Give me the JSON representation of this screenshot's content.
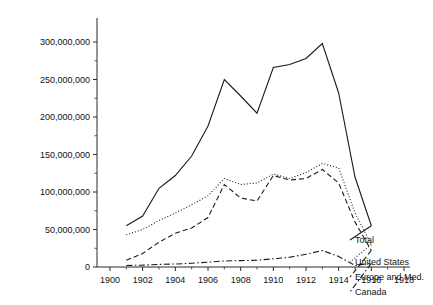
{
  "chart_data": {
    "type": "line",
    "title": "",
    "subtitle": "",
    "xlabel": "",
    "ylabel": "",
    "xlim": [
      1899,
      1918.6
    ],
    "ylim": [
      0,
      310000000
    ],
    "grid": false,
    "legend_position": "inline-right",
    "x_ticks_major": [
      1900,
      1902,
      1904,
      1906,
      1908,
      1910,
      1912,
      1914,
      1916,
      1918
    ],
    "x_ticks_minor": [
      1901,
      1903,
      1905,
      1907,
      1909,
      1911,
      1913,
      1915,
      1917
    ],
    "x_tick_labels": [
      "1900",
      "1902",
      "1904",
      "1906",
      "1908",
      "1910",
      "1912",
      "1914",
      "1916",
      "1918"
    ],
    "y_ticks_major": [
      0,
      50000000,
      100000000,
      150000000,
      200000000,
      250000000,
      300000000
    ],
    "y_ticks_minor": [
      25000000,
      75000000,
      125000000,
      175000000,
      225000000,
      275000000
    ],
    "y_tick_labels": [
      "0",
      "50,000,000",
      "100,000,000",
      "150,000,000",
      "200,000,000",
      "250,000,000",
      "300,000,000"
    ],
    "x": [
      1901,
      1902,
      1903,
      1904,
      1905,
      1906,
      1907,
      1908,
      1909,
      1910,
      1911,
      1912,
      1913,
      1914,
      1915,
      1916
    ],
    "series": [
      {
        "name": "Total",
        "style": "solid",
        "color": "#1a1a1a",
        "label_value": "Total",
        "values": [
          55000000,
          68000000,
          105000000,
          122000000,
          148000000,
          188000000,
          250000000,
          228000000,
          205000000,
          266000000,
          270000000,
          278000000,
          298000000,
          232000000,
          120000000,
          55000000
        ]
      },
      {
        "name": "United States",
        "style": "dotted",
        "color": "#1a1a1a",
        "label_value": "United States",
        "values": [
          43000000,
          50000000,
          62000000,
          72000000,
          83000000,
          95000000,
          118000000,
          110000000,
          112000000,
          124000000,
          118000000,
          126000000,
          138000000,
          132000000,
          72000000,
          30000000
        ]
      },
      {
        "name": "Europe and Med.",
        "style": "dashed",
        "color": "#1a1a1a",
        "label_value": "Europe and Med.",
        "values": [
          9000000,
          18000000,
          33000000,
          45000000,
          52000000,
          66000000,
          110000000,
          92000000,
          88000000,
          122000000,
          116000000,
          118000000,
          130000000,
          112000000,
          60000000,
          22000000
        ]
      },
      {
        "name": "Canada",
        "style": "dashdot",
        "color": "#1a1a1a",
        "label_value": "Canada",
        "values": [
          2000000,
          2500000,
          3500000,
          4000000,
          5000000,
          6500000,
          8000000,
          8500000,
          9000000,
          11000000,
          13000000,
          17000000,
          22000000,
          14000000,
          2000000,
          5000000
        ]
      }
    ]
  }
}
